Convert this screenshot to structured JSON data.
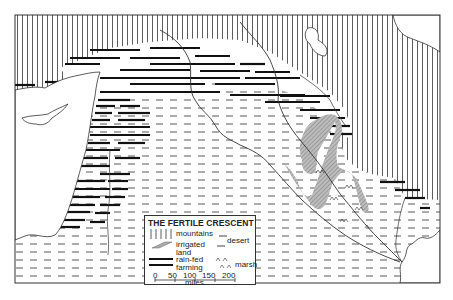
{
  "map": {
    "title": "THE FERTILE CRESCENT",
    "colors": {
      "ink": "#222222",
      "background": "#ffffff",
      "irrigated": "#9a9a9a"
    },
    "legend": {
      "items": [
        {
          "symbol": "vertical-hatch",
          "label": "mountains"
        },
        {
          "symbol": "dashes",
          "label": "desert"
        },
        {
          "symbol": "cross-hatch",
          "label_line1": "irrigated",
          "label_line2": "land"
        },
        {
          "symbol": "thick-bars",
          "label_line1": "rain-fed",
          "label_line2": "farming"
        },
        {
          "symbol": "marsh-tufts",
          "label": "marsh"
        }
      ],
      "scale": {
        "ticks": [
          "0",
          "50",
          "100",
          "150",
          "200"
        ],
        "unit": "miles"
      }
    }
  }
}
